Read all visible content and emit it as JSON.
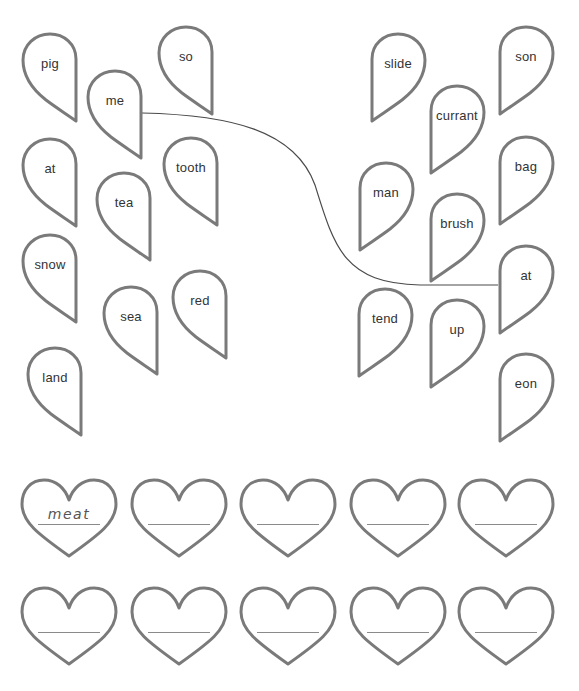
{
  "worksheet": {
    "stroke_color": "#7a7a7a",
    "text_color": "#333333",
    "left_halves": [
      {
        "word": "pig",
        "x": 22,
        "y": 33
      },
      {
        "word": "so",
        "x": 158,
        "y": 26
      },
      {
        "word": "me",
        "x": 87,
        "y": 70
      },
      {
        "word": "at",
        "x": 22,
        "y": 138
      },
      {
        "word": "tooth",
        "x": 163,
        "y": 137
      },
      {
        "word": "tea",
        "x": 96,
        "y": 172
      },
      {
        "word": "snow",
        "x": 22,
        "y": 234
      },
      {
        "word": "red",
        "x": 172,
        "y": 270
      },
      {
        "word": "sea",
        "x": 103,
        "y": 286
      },
      {
        "word": "land",
        "x": 27,
        "y": 347
      }
    ],
    "right_halves": [
      {
        "word": "slide",
        "x": 370,
        "y": 33
      },
      {
        "word": "son",
        "x": 498,
        "y": 26
      },
      {
        "word": "currant",
        "x": 429,
        "y": 85
      },
      {
        "word": "bag",
        "x": 498,
        "y": 136
      },
      {
        "word": "man",
        "x": 358,
        "y": 162
      },
      {
        "word": "brush",
        "x": 429,
        "y": 193
      },
      {
        "word": "at",
        "x": 498,
        "y": 245
      },
      {
        "word": "tend",
        "x": 357,
        "y": 288
      },
      {
        "word": "up",
        "x": 429,
        "y": 299
      },
      {
        "word": "eon",
        "x": 498,
        "y": 353
      }
    ],
    "connector": {
      "from": "me",
      "to": "at",
      "path": "M142,113 C230,115 295,130 315,185 C335,250 345,283 420,285 L498,285"
    },
    "answer_hearts": [
      {
        "answer": "meat",
        "x": 20,
        "y": 478
      },
      {
        "answer": "",
        "x": 130,
        "y": 478
      },
      {
        "answer": "",
        "x": 239,
        "y": 478
      },
      {
        "answer": "",
        "x": 349,
        "y": 478
      },
      {
        "answer": "",
        "x": 457,
        "y": 478
      },
      {
        "answer": "",
        "x": 20,
        "y": 586
      },
      {
        "answer": "",
        "x": 130,
        "y": 586
      },
      {
        "answer": "",
        "x": 239,
        "y": 586
      },
      {
        "answer": "",
        "x": 349,
        "y": 586
      },
      {
        "answer": "",
        "x": 457,
        "y": 586
      }
    ]
  }
}
